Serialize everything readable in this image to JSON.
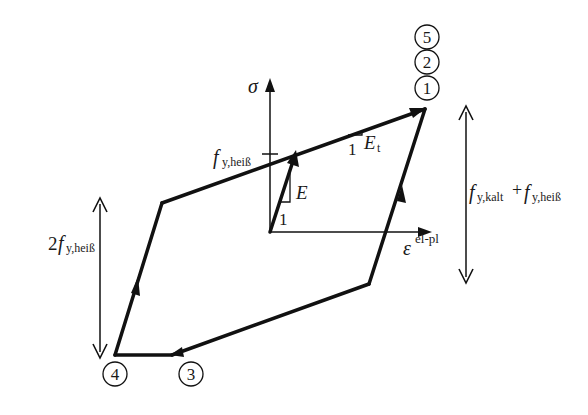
{
  "diagram": {
    "axes": {
      "y_label": "σ",
      "x_label_main": "ε",
      "x_label_sup": "el-pl"
    },
    "labels": {
      "fy_heiss_main": "f",
      "fy_heiss_sub": "y,heiß",
      "E": "E",
      "E_one": "1",
      "Et_main": "E",
      "Et_sub": "t",
      "Et_one": "1",
      "range_right_f1": "f",
      "range_right_sub1": "y,kalt",
      "range_right_plus": "+",
      "range_right_f2": "f",
      "range_right_sub2": "y,heiß",
      "range_left_two": "2",
      "range_left_f": "f",
      "range_left_sub": "y,heiß"
    },
    "points": [
      {
        "id": "1",
        "label": "1"
      },
      {
        "id": "2",
        "label": "2"
      },
      {
        "id": "3",
        "label": "3"
      },
      {
        "id": "4",
        "label": "4"
      },
      {
        "id": "5",
        "label": "5"
      }
    ],
    "colors": {
      "line": "#111111",
      "background": "#ffffff"
    }
  }
}
